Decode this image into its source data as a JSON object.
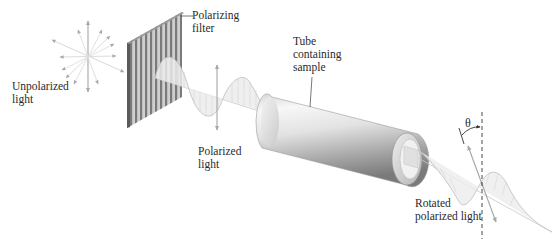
{
  "diagram": {
    "labels": {
      "unpolarized_light": [
        "Unpolarized",
        "light"
      ],
      "polarizing_filter": [
        "Polarizing",
        "filter"
      ],
      "polarized_light": [
        "Polarized",
        "light"
      ],
      "tube": [
        "Tube",
        "containing",
        "sample"
      ],
      "rotated_light": [
        "Rotated",
        "polarized light"
      ],
      "angle_symbol": "θ"
    },
    "colors": {
      "arrow": "#a8a8a8",
      "wave_stroke": "#bdbdbd",
      "wave_fill": "#e6e6e6",
      "filter_dark": "#6e6e6e",
      "filter_light": "#cfcfcf",
      "tube_light": "#f4f4f4",
      "tube_dark": "#8a8a8a",
      "text": "#2a2a2a",
      "dashed_line": "#333333"
    }
  }
}
